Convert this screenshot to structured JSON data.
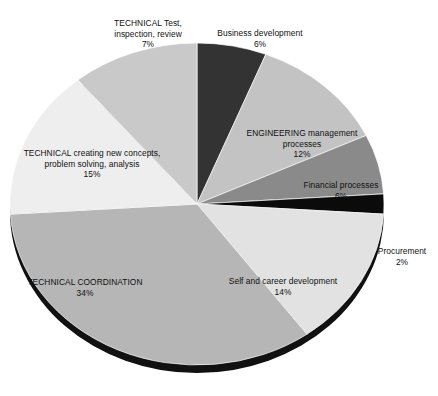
{
  "chart_data": {
    "type": "pie",
    "title": "",
    "subtitle": "",
    "xlabel": "",
    "ylabel": "",
    "legend_position": "none",
    "grid": false,
    "unit": "%",
    "start_angle_deg": 0,
    "direction": "clockwise",
    "categories": [
      "Business development",
      "ENGINEERING management processes",
      "Financial processes",
      "Procurement",
      "Self and career development",
      "TECHNICAL COORDINATION",
      "TECHNICAL creating new concepts, problem solving, analysis",
      "TECHNICAL Test, inspection, review"
    ],
    "values": [
      6,
      12,
      6,
      2,
      14,
      34,
      15,
      7
    ],
    "colors": [
      "#333333",
      "#c3c3c3",
      "#8a8a8a",
      "#0b0b0b",
      "#e2e2e2",
      "#b6b6b6",
      "#eeeeee",
      "#c9c9c9"
    ],
    "slices": [
      {
        "name": "Business development",
        "label_line1": "Business development",
        "label_line2": "",
        "percent_text": "6%",
        "value": 6,
        "color": "#333333",
        "start_deg": 0,
        "end_deg": 21.6
      },
      {
        "name": "ENGINEERING management processes",
        "label_line1": "ENGINEERING management",
        "label_line2": "processes",
        "percent_text": "12%",
        "value": 12,
        "color": "#c3c3c3",
        "start_deg": 21.6,
        "end_deg": 64.8
      },
      {
        "name": "Financial processes",
        "label_line1": "Financial processes",
        "label_line2": "",
        "percent_text": "6%",
        "value": 6,
        "color": "#8a8a8a",
        "start_deg": 64.8,
        "end_deg": 86.4
      },
      {
        "name": "Procurement",
        "label_line1": "Procurement",
        "label_line2": "",
        "percent_text": "2%",
        "value": 2,
        "color": "#0b0b0b",
        "start_deg": 86.4,
        "end_deg": 93.6
      },
      {
        "name": "Self and career development",
        "label_line1": "Self and career development",
        "label_line2": "",
        "percent_text": "14%",
        "value": 14,
        "color": "#e2e2e2",
        "start_deg": 93.6,
        "end_deg": 144.0
      },
      {
        "name": "TECHNICAL COORDINATION",
        "label_line1": "TECHNICAL COORDINATION",
        "label_line2": "",
        "percent_text": "34%",
        "value": 34,
        "color": "#b6b6b6",
        "start_deg": 144.0,
        "end_deg": 266.4
      },
      {
        "name": "TECHNICAL creating new concepts, problem solving, analysis",
        "label_line1": "TECHNICAL creating new concepts,",
        "label_line2": "problem solving, analysis",
        "percent_text": "15%",
        "value": 15,
        "color": "#eeeeee",
        "start_deg": 266.4,
        "end_deg": 320.4
      },
      {
        "name": "TECHNICAL Test, inspection, review",
        "label_line1": "TECHNICAL Test,",
        "label_line2": "inspection, review",
        "percent_text": "7%",
        "value": 7,
        "color": "#c9c9c9",
        "start_deg": 320.4,
        "end_deg": 360.0
      }
    ]
  },
  "style": {
    "shadow_color": "#111111",
    "background": "#ffffff",
    "text_color": "#111111"
  }
}
